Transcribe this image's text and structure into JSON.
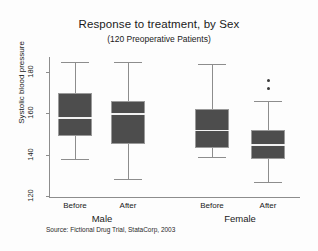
{
  "chart_data": {
    "type": "box",
    "title": "Response to treatment, by Sex",
    "subtitle": "(120 Preoperative Patients)",
    "xlabel": "",
    "ylabel": "Systolic blood pressure",
    "ylim": [
      115,
      190
    ],
    "yticks": [
      120,
      140,
      160,
      180
    ],
    "ytick_labels": [
      "120",
      "140",
      "160",
      "180"
    ],
    "grid": false,
    "legend": "none",
    "source_note": "Source: Fictional Drug Trial, StataCorp, 2003",
    "groups": [
      {
        "label": "Male",
        "center_px": 102
      },
      {
        "label": "Female",
        "center_px": 240
      }
    ],
    "categories": [
      "Before",
      "After",
      "Before",
      "After"
    ],
    "boxes": [
      {
        "name": "male-before",
        "group": "Male",
        "category": "Before",
        "whisker_high": 185,
        "q3": 170,
        "median": 158,
        "q1": 149,
        "whisker_low": 138,
        "outliers": []
      },
      {
        "name": "male-after",
        "group": "Male",
        "category": "After",
        "whisker_high": 185,
        "q3": 166,
        "median": 160,
        "q1": 145,
        "whisker_low": 128,
        "outliers": []
      },
      {
        "name": "female-before",
        "group": "Female",
        "category": "Before",
        "whisker_high": 184,
        "q3": 162,
        "median": 152,
        "q1": 143,
        "whisker_low": 139,
        "outliers": []
      },
      {
        "name": "female-after",
        "group": "Female",
        "category": "After",
        "whisker_high": 166,
        "q3": 152,
        "median": 145,
        "q1": 138,
        "whisker_low": 127,
        "outliers": [
          176,
          172
        ]
      }
    ],
    "colors": {
      "box_fill": "#4d4d4d",
      "box_edge": "#9a9a9a",
      "median_line": "#f2f2f2",
      "whisker": "#8d8d8d",
      "axis": "#8d8d8d",
      "outlier": "#3a3a3a",
      "background": "#fdfdfd",
      "text": "#1a1a1a"
    }
  }
}
